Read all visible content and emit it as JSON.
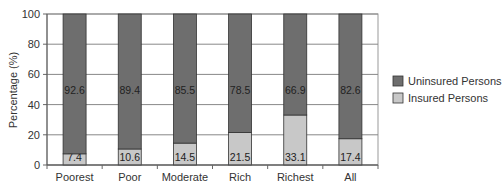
{
  "chart_data": {
    "type": "bar",
    "stacked": true,
    "title": "",
    "xlabel": "",
    "ylabel": "Percentage (%)",
    "ylim": [
      0,
      100
    ],
    "yticks": [
      0,
      20,
      40,
      60,
      80,
      100
    ],
    "grid": true,
    "legend_position": "right",
    "categories": [
      "Poorest",
      "Poor",
      "Moderate",
      "Rich",
      "Richest",
      "All"
    ],
    "series": [
      {
        "name": "Insured Persons",
        "color": "#c8c8c8",
        "values": [
          7.4,
          10.6,
          14.5,
          21.5,
          33.1,
          17.4
        ]
      },
      {
        "name": "Uninsured Persons",
        "color": "#6e6e6e",
        "values": [
          92.6,
          89.4,
          85.5,
          78.5,
          66.9,
          82.6
        ]
      }
    ]
  },
  "legend": {
    "items": [
      {
        "label": "Uninsured Persons",
        "color": "#6e6e6e"
      },
      {
        "label": "Insured Persons",
        "color": "#c8c8c8"
      }
    ]
  }
}
